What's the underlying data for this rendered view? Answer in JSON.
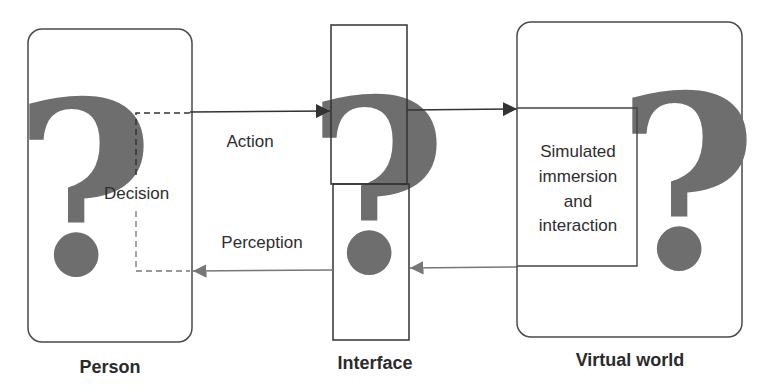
{
  "diagram": {
    "nodes": {
      "person": {
        "title": "Person",
        "symbol": "?"
      },
      "interface": {
        "title": "Interface",
        "symbol": "?"
      },
      "virtual_world": {
        "title": "Virtual world",
        "symbol": "?"
      }
    },
    "inner": {
      "decision": "Decision",
      "simulated_line1": "Simulated",
      "simulated_line2": "immersion",
      "simulated_line3": "and",
      "simulated_line4": "interaction"
    },
    "edges": {
      "action": "Action",
      "perception": "Perception"
    },
    "colors": {
      "stroke": "#3a3a3a",
      "question_mark": "#6e6e6e",
      "text": "#2e2e2e"
    }
  }
}
